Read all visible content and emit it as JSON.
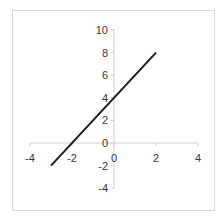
{
  "chart_data": {
    "type": "line",
    "title": "",
    "xlabel": "",
    "ylabel": "",
    "xlim": [
      -4,
      4
    ],
    "ylim": [
      -4,
      10
    ],
    "x_ticks": [
      -4,
      -2,
      0,
      2,
      4
    ],
    "y_ticks": [
      10,
      8,
      6,
      4,
      2,
      0,
      -2,
      -4
    ],
    "x_tick_labels": [
      "-4",
      "-2",
      "0",
      "2",
      "4"
    ],
    "y_tick_labels": [
      "10",
      "8",
      "6",
      "4",
      "2",
      "0",
      "-2",
      "-4"
    ],
    "origin_label": "0",
    "grid": false,
    "legend": null,
    "series": [
      {
        "name": "y = 2x + 4",
        "x": [
          -3,
          2
        ],
        "y": [
          -2,
          8
        ],
        "color": "#1a1a1a"
      }
    ]
  }
}
